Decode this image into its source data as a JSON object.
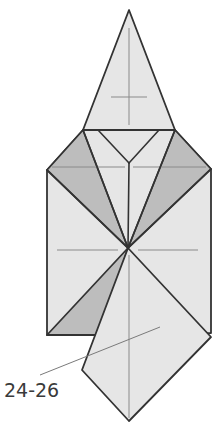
{
  "diagram": {
    "type": "origami-step",
    "step_label": "24-26",
    "colors": {
      "paper": "#e6e6e6",
      "paper_shaded": "#bdbdbd",
      "outline": "#333333",
      "crease": "#8a8a8a",
      "background": "#ffffff"
    },
    "regions": [
      {
        "name": "top-cap-triangle",
        "points": [
          [
            129,
            10
          ],
          [
            83,
            130
          ],
          [
            175,
            130
          ]
        ],
        "fill": "paper"
      },
      {
        "name": "square-body",
        "points": [
          [
            47,
            170
          ],
          [
            83,
            130
          ],
          [
            175,
            130
          ],
          [
            211,
            169
          ],
          [
            211,
            333
          ],
          [
            47,
            335
          ]
        ],
        "fill": "paper"
      },
      {
        "name": "left-shaded-flap",
        "points": [
          [
            47,
            170
          ],
          [
            83,
            130
          ],
          [
            128,
            248
          ]
        ],
        "fill": "paper_shaded"
      },
      {
        "name": "right-shaded-flap",
        "points": [
          [
            211,
            169
          ],
          [
            175,
            130
          ],
          [
            128,
            248
          ]
        ],
        "fill": "paper_shaded"
      },
      {
        "name": "bottom-left-shaded",
        "points": [
          [
            47,
            335
          ],
          [
            128,
            248
          ],
          [
            100,
            335
          ]
        ],
        "fill": "paper_shaded"
      },
      {
        "name": "bottom-kite-flap",
        "points": [
          [
            128,
            248
          ],
          [
            211,
            337
          ],
          [
            129,
            421
          ],
          [
            82,
            370
          ]
        ],
        "fill": "paper"
      }
    ],
    "lines": [
      {
        "name": "inner-v-left",
        "from": [
          98,
          130
        ],
        "to": [
          129,
          163
        ]
      },
      {
        "name": "inner-v-right",
        "from": [
          159,
          130
        ],
        "to": [
          129,
          163
        ]
      },
      {
        "name": "left-fan-line",
        "from": [
          83,
          130
        ],
        "to": [
          128,
          248
        ]
      },
      {
        "name": "right-fan-line",
        "from": [
          175,
          130
        ],
        "to": [
          128,
          248
        ]
      },
      {
        "name": "left-diag",
        "from": [
          47,
          170
        ],
        "to": [
          128,
          248
        ]
      },
      {
        "name": "right-diag",
        "from": [
          211,
          169
        ],
        "to": [
          128,
          248
        ]
      },
      {
        "name": "center-spine",
        "from": [
          129,
          163
        ],
        "to": [
          128,
          248
        ]
      }
    ],
    "creases": [
      {
        "name": "cap-vertical",
        "from": [
          129,
          28
        ],
        "to": [
          129,
          125
        ]
      },
      {
        "name": "cap-crossbar",
        "from": [
          111,
          97
        ],
        "to": [
          147,
          97
        ]
      },
      {
        "name": "top-crease-left",
        "from": [
          52,
          167
        ],
        "to": [
          125,
          167
        ]
      },
      {
        "name": "top-crease-right",
        "from": [
          133,
          167
        ],
        "to": [
          206,
          167
        ]
      },
      {
        "name": "mid-crease-left",
        "from": [
          57,
          250
        ],
        "to": [
          118,
          250
        ]
      },
      {
        "name": "mid-crease-right",
        "from": [
          138,
          250
        ],
        "to": [
          198,
          250
        ]
      },
      {
        "name": "kite-vertical",
        "from": [
          129,
          255
        ],
        "to": [
          129,
          418
        ]
      }
    ],
    "leader_line": {
      "from": [
        40,
        375
      ],
      "to": [
        160,
        327
      ]
    }
  }
}
